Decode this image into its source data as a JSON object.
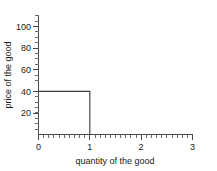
{
  "chart_data": {
    "type": "line",
    "title": "",
    "xlabel": "quantity of the good",
    "ylabel": "price of the good",
    "xlim": [
      0,
      3
    ],
    "ylim": [
      0,
      110
    ],
    "grid": false,
    "legend": null,
    "x_ticks": [
      "0",
      "1",
      "2",
      "3"
    ],
    "x_tick_values": [
      0,
      1,
      2,
      3
    ],
    "x_minor_step": 0.1,
    "y_ticks": [
      "20",
      "40",
      "60",
      "80",
      "100"
    ],
    "y_tick_values": [
      20,
      40,
      60,
      80,
      100
    ],
    "y_minor_step": 5,
    "series": [
      {
        "name": "step-demand-curve",
        "color": "#3d3d3d",
        "points": [
          {
            "x": 0,
            "y": 40
          },
          {
            "x": 1,
            "y": 40
          },
          {
            "x": 1,
            "y": 0
          }
        ]
      }
    ],
    "step_price": 40,
    "step_quantity": 1
  },
  "axes": {
    "x_title": "quantity of the good",
    "y_title": "price of the good"
  }
}
